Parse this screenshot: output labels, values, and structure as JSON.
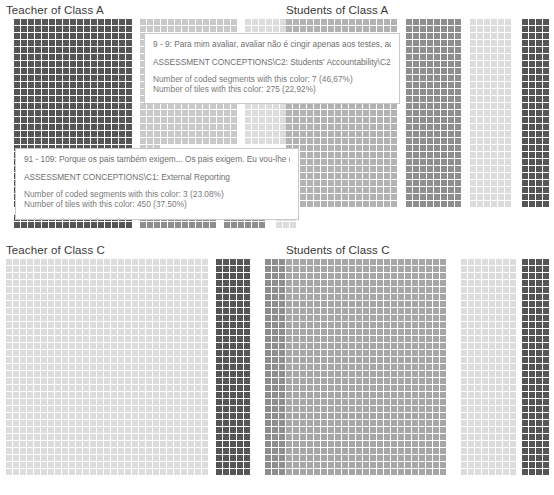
{
  "panels": [
    {
      "id": "teacher-class-a",
      "title": "Teacher of Class A",
      "x": 6,
      "y": 3,
      "plot_w": 272,
      "plot_h": 212
    },
    {
      "id": "students-class-a",
      "title": "Students of Class A",
      "x": 286,
      "y": 3,
      "plot_w": 268,
      "plot_h": 212
    },
    {
      "id": "teacher-class-c",
      "title": "Teacher of Class C",
      "x": 6,
      "y": 243,
      "plot_w": 272,
      "plot_h": 238
    },
    {
      "id": "students-class-c",
      "title": "Students of Class C",
      "x": 286,
      "y": 243,
      "plot_w": 268,
      "plot_h": 238
    }
  ],
  "colors": {
    "background": "#ffffff",
    "title_text": "#3a3a3a",
    "tooltip_border": "#c9c9c9",
    "tooltip_bg": "#ffffff",
    "tooltip_text": "#6b6b6b",
    "tile_darkest": "#555555",
    "tile_dark": "#6e6e6e",
    "tile_mid": "#8e8e8e",
    "tile_light": "#b2b2b2",
    "tile_lighter": "#c9c9c9",
    "tile_lightest": "#dcdcdc",
    "tile_palest": "#e6e6e6"
  },
  "tooltips": [
    {
      "id": "tooltip-assessment-grading",
      "quote": "9 - 9: Para mim avaliar, avaliar não é cingir apenas aos testes, aqui",
      "code": "ASSESSMENT CONCEPTIONS\\C2: Students' Accountability\\C2: Grading",
      "segments_line": "Number of coded segments with this color: 7 (46,67%)",
      "tiles_line": "Number of tiles with this color: 275 (22,92%)",
      "segments_count": 7,
      "segments_percent": "46,67%",
      "tiles_count": 275,
      "tiles_percent": "22,92%"
    },
    {
      "id": "tooltip-external-reporting",
      "quote": "91 - 109: Porque os pais também exigem... Os pais exigem. Eu vou-lhe dar",
      "code": "ASSESSMENT CONCEPTIONS\\C1: External Reporting",
      "segments_line": "Number of coded segments with this color: 3 (23.08%)",
      "tiles_line": "Number of tiles with this color: 450 (37.50%)",
      "segments_count": 3,
      "segments_percent": "23.08%",
      "tiles_count": 450,
      "tiles_percent": "37.50%"
    }
  ],
  "chart_data": {
    "type": "heatmap",
    "title": "",
    "tile_size_px": 6,
    "tile_gap_px": 1,
    "legend_position": "none",
    "grid": false,
    "panels": [
      {
        "name": "Teacher of Class A",
        "blocks": [
          {
            "color": "#555555",
            "cols": 17,
            "rows": 26,
            "x": 0,
            "y": 0
          },
          {
            "color": "#c9c9c9",
            "cols": 14,
            "rows": 26,
            "x": 126,
            "y": 0
          },
          {
            "color": "#d8d8d8",
            "cols": 6,
            "rows": 26,
            "x": 231,
            "y": 0
          },
          {
            "color": "#555555",
            "cols": 17,
            "rows": 3,
            "x": 0,
            "y": 196
          },
          {
            "color": "#8e8e8e",
            "cols": 11,
            "rows": 2,
            "x": 126,
            "y": 203
          },
          {
            "color": "#8e8e8e",
            "cols": 6,
            "rows": 2,
            "x": 214,
            "y": 203
          },
          {
            "color": "#d8d8d8",
            "cols": 3,
            "rows": 2,
            "x": 266,
            "y": 203
          }
        ]
      },
      {
        "name": "Students of Class A",
        "blocks": [
          {
            "color": "#b2b2b2",
            "cols": 16,
            "rows": 27,
            "x": 0,
            "y": 0
          },
          {
            "color": "#8e8e8e",
            "cols": 8,
            "rows": 27,
            "x": 120,
            "y": 0
          },
          {
            "color": "#dcdcdc",
            "cols": 6,
            "rows": 27,
            "x": 184,
            "y": 0
          },
          {
            "color": "#555555",
            "cols": 4,
            "rows": 27,
            "x": 236,
            "y": 0
          }
        ]
      },
      {
        "name": "Teacher of Class C",
        "blocks": [
          {
            "color": "#dcdcdc",
            "cols": 29,
            "rows": 32,
            "x": 0,
            "y": 0
          },
          {
            "color": "#555555",
            "cols": 5,
            "rows": 32,
            "x": 210,
            "y": 0
          },
          {
            "color": "#8e8e8e",
            "cols": 5,
            "rows": 32,
            "x": 259,
            "y": 0
          }
        ]
      },
      {
        "name": "Students of Class C",
        "blocks": [
          {
            "color": "#a6a6a6",
            "cols": 23,
            "rows": 32,
            "x": 0,
            "y": 0
          },
          {
            "color": "#dcdcdc",
            "cols": 8,
            "rows": 32,
            "x": 175,
            "y": 0
          },
          {
            "color": "#555555",
            "cols": 4,
            "rows": 32,
            "x": 236,
            "y": 0
          },
          {
            "color": "#8e8e8e",
            "cols": 2,
            "rows": 32,
            "x": 268,
            "y": 0
          }
        ]
      }
    ]
  }
}
